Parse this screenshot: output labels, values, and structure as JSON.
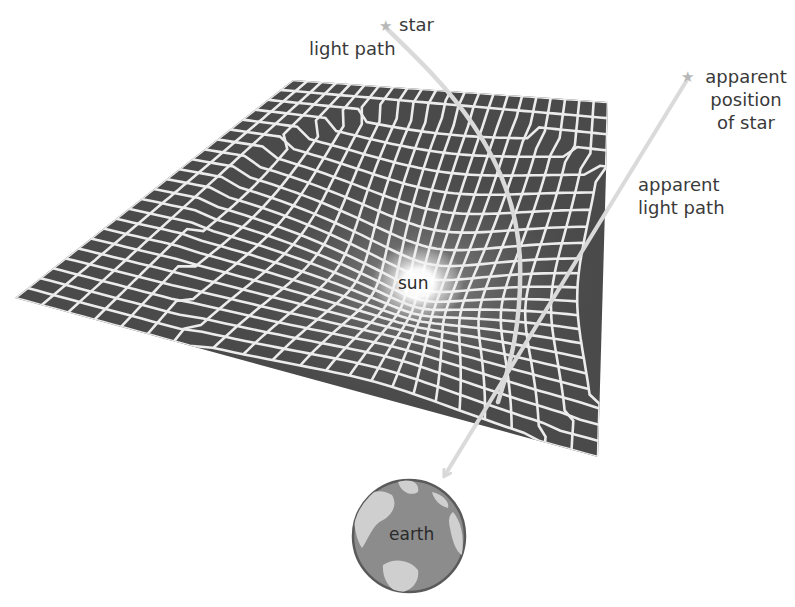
{
  "diagram": {
    "type": "gravitational-lensing",
    "labels": {
      "star": "star",
      "light_path": "light path",
      "apparent_position_line1": "apparent",
      "apparent_position_line2": "position",
      "apparent_position_line3": "of star",
      "apparent_light_path_line1": "apparent",
      "apparent_light_path_line2": "light path",
      "sun": "sun",
      "earth": "earth"
    },
    "icons": {
      "star": "★",
      "apparent_star": "★"
    },
    "colors": {
      "grid_fill": "#4a4a4a",
      "grid_lines": "#ececec",
      "light_path": "#dcdcdc",
      "sun_glow": "#ffffff",
      "earth_ocean": "#8c8c8c",
      "earth_land": "#cfcfcf",
      "label_text": "#3a3a3a",
      "star": "#b8b8b8"
    }
  }
}
